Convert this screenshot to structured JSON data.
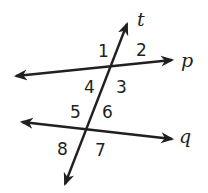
{
  "diagram": {
    "lines": {
      "p": {
        "label": "p",
        "x1": 14,
        "y1": 76,
        "x2": 174,
        "y2": 60
      },
      "q": {
        "label": "q",
        "x1": 20,
        "y1": 122,
        "x2": 174,
        "y2": 139
      },
      "t": {
        "label": "t",
        "x1": 64,
        "y1": 186,
        "x2": 128,
        "y2": 22
      }
    },
    "angles": [
      {
        "id": "1",
        "label": "1"
      },
      {
        "id": "2",
        "label": "2"
      },
      {
        "id": "3",
        "label": "3"
      },
      {
        "id": "4",
        "label": "4"
      },
      {
        "id": "5",
        "label": "5"
      },
      {
        "id": "6",
        "label": "6"
      },
      {
        "id": "7",
        "label": "7"
      },
      {
        "id": "8",
        "label": "8"
      }
    ],
    "colors": {
      "ink": "#231f20",
      "background": "#ffffff"
    }
  }
}
